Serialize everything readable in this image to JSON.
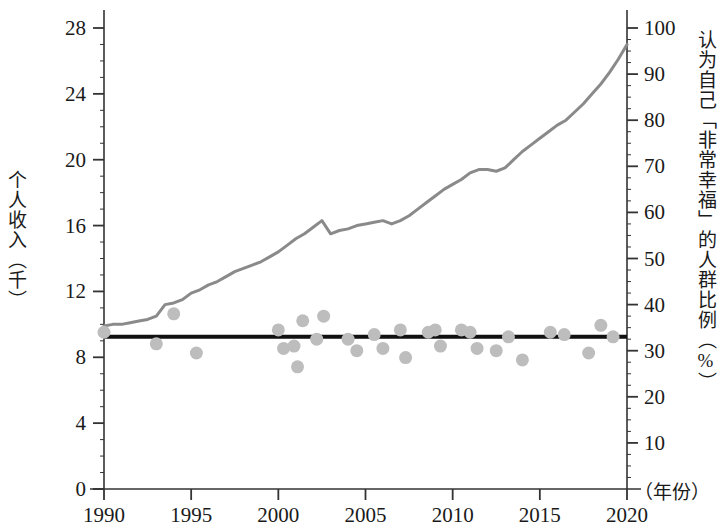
{
  "chart_data": {
    "type": "line",
    "title": "",
    "subtitle": "",
    "xlabel": "（年份）",
    "ylabel": "个人收入（千）",
    "y2label": "认为自己「非常幸福」的人群比例（%）",
    "xlim": [
      1990,
      2020
    ],
    "ylim": [
      0,
      28
    ],
    "y2lim": [
      0,
      100
    ],
    "grid": false,
    "legend": "none",
    "xticks": [
      1990,
      1995,
      2000,
      2005,
      2010,
      2015,
      2020
    ],
    "xtick_labels": [
      "1990",
      "1995",
      "2000",
      "2005",
      "2010",
      "2015",
      "2020"
    ],
    "yticks": [
      0,
      4,
      8,
      12,
      16,
      20,
      24,
      28
    ],
    "ytick_labels": [
      "0",
      "4",
      "8",
      "12",
      "16",
      "20",
      "24",
      "28"
    ],
    "y2ticks": [
      10,
      20,
      30,
      40,
      50,
      60,
      70,
      80,
      90,
      100
    ],
    "y2tick_labels": [
      "10",
      "20",
      "30",
      "40",
      "50",
      "60",
      "70",
      "80",
      "90",
      "100"
    ],
    "y_minor_tick_step": 1,
    "series": [
      {
        "name": "个人收入（千）",
        "type": "line",
        "axis": "left",
        "color": "#8a8a8a",
        "line_width": 3,
        "x": [
          1990,
          1990.5,
          1991,
          1991.5,
          1992,
          1992.5,
          1993,
          1993.5,
          1994,
          1994.5,
          1995,
          1995.5,
          1996,
          1996.5,
          1997,
          1997.5,
          1998,
          1998.5,
          1999,
          1999.5,
          2000,
          2000.5,
          2001,
          2001.5,
          2002,
          2002.5,
          2003,
          2003.5,
          2004,
          2004.5,
          2005,
          2005.5,
          2006,
          2006.5,
          2007,
          2007.5,
          2008,
          2008.5,
          2009,
          2009.5,
          2010,
          2010.5,
          2011,
          2011.5,
          2012,
          2012.5,
          2013,
          2013.5,
          2014,
          2014.5,
          2015,
          2015.5,
          2016,
          2016.5,
          2017,
          2017.5,
          2018,
          2018.5,
          2019,
          2019.5,
          2020
        ],
        "y": [
          9.9,
          10.0,
          10.0,
          10.1,
          10.2,
          10.3,
          10.5,
          11.2,
          11.3,
          11.5,
          11.9,
          12.1,
          12.4,
          12.6,
          12.9,
          13.2,
          13.4,
          13.6,
          13.8,
          14.1,
          14.4,
          14.8,
          15.2,
          15.5,
          15.9,
          16.3,
          15.5,
          15.7,
          15.8,
          16.0,
          16.1,
          16.2,
          16.3,
          16.1,
          16.3,
          16.6,
          17.0,
          17.4,
          17.8,
          18.2,
          18.5,
          18.8,
          19.2,
          19.4,
          19.4,
          19.3,
          19.5,
          20.0,
          20.5,
          20.9,
          21.3,
          21.7,
          22.1,
          22.4,
          22.9,
          23.4,
          24.0,
          24.6,
          25.3,
          26.1,
          27.0
        ]
      },
      {
        "name": "认为自己「非常幸福」的人群比例（%）",
        "type": "scatter",
        "axis": "right",
        "color": "#bdbdbd",
        "marker_size": 13,
        "points": [
          [
            1990.0,
            34.0
          ],
          [
            1993.0,
            31.5
          ],
          [
            1994.0,
            38.0
          ],
          [
            1995.3,
            29.5
          ],
          [
            2000.0,
            34.5
          ],
          [
            2000.3,
            30.5
          ],
          [
            2000.9,
            31.0
          ],
          [
            2001.1,
            26.5
          ],
          [
            2001.4,
            36.5
          ],
          [
            2002.2,
            32.5
          ],
          [
            2002.6,
            37.5
          ],
          [
            2004.0,
            32.5
          ],
          [
            2004.5,
            30.0
          ],
          [
            2005.5,
            33.5
          ],
          [
            2006.0,
            30.5
          ],
          [
            2007.0,
            34.5
          ],
          [
            2007.3,
            28.5
          ],
          [
            2008.6,
            34.0
          ],
          [
            2009.0,
            34.5
          ],
          [
            2009.3,
            31.0
          ],
          [
            2010.5,
            34.5
          ],
          [
            2011.0,
            34.0
          ],
          [
            2011.4,
            30.5
          ],
          [
            2012.5,
            30.0
          ],
          [
            2013.2,
            33.0
          ],
          [
            2014.0,
            28.0
          ],
          [
            2015.6,
            34.0
          ],
          [
            2016.4,
            33.5
          ],
          [
            2017.8,
            29.5
          ],
          [
            2018.5,
            35.5
          ],
          [
            2019.2,
            33.0
          ]
        ]
      },
      {
        "name": "趋势线",
        "type": "trendline",
        "axis": "right",
        "color": "#111111",
        "line_width": 4,
        "x": [
          1990,
          2020
        ],
        "y": [
          33.0,
          33.0
        ]
      }
    ]
  },
  "axes": {
    "left": {
      "title": "个人收入（千）",
      "ticks": [
        "0",
        "4",
        "8",
        "12",
        "16",
        "20",
        "24",
        "28"
      ]
    },
    "right": {
      "title": "认为自己「非常幸福」的人群比例（%）",
      "ticks": [
        "10",
        "20",
        "30",
        "40",
        "50",
        "60",
        "70",
        "80",
        "90",
        "100"
      ]
    },
    "bottom": {
      "unit": "（年份）",
      "ticks": [
        "1990",
        "1995",
        "2000",
        "2005",
        "2010",
        "2015",
        "2020"
      ]
    }
  },
  "colors": {
    "line": "#8a8a8a",
    "scatter": "#bdbdbd",
    "trend": "#111111",
    "axis": "#333333",
    "background": "#ffffff"
  }
}
